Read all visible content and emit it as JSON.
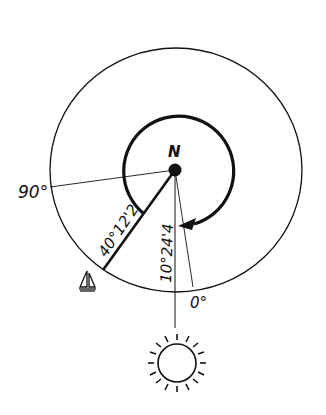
{
  "diagram": {
    "center_label": "N",
    "labels": {
      "ninety": "90°",
      "zero": "0°",
      "boat_distance": "40°12'2",
      "sun_angle": "10°24'4"
    },
    "icons": {
      "boat": "sailboat-icon",
      "sun": "sun-icon"
    },
    "colors": {
      "ink": "#111111",
      "background": "#ffffff"
    }
  }
}
